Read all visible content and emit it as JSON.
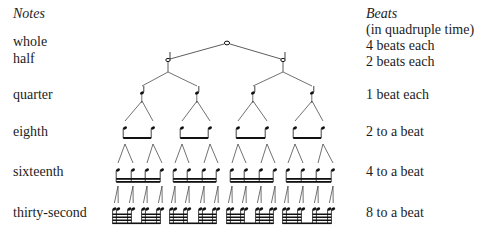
{
  "left_column": {
    "header": "Notes",
    "rows": [
      {
        "label": "whole",
        "y": 12
      },
      {
        "label": "half",
        "y": 28
      },
      {
        "label": "quarter",
        "y": 61
      },
      {
        "label": "eighth",
        "y": 104
      },
      {
        "label": "sixteenth",
        "y": 146
      },
      {
        "label": "thirty-second",
        "y": 188
      }
    ]
  },
  "right_column": {
    "header": "Beats",
    "subheader": "(in quadruple time)",
    "rows": [
      {
        "label": "4 beats each"
      },
      {
        "label": "2 beats each"
      },
      {
        "label": "1 beat each"
      },
      {
        "label": "2 to a beat"
      },
      {
        "label": "4 to a beat"
      },
      {
        "label": "8 to a beat"
      }
    ]
  },
  "tree": {
    "levels": [
      {
        "name": "whole",
        "count": 1,
        "y": 43,
        "x": [
          227
        ]
      },
      {
        "name": "half",
        "count": 2,
        "y": 60,
        "x": [
          168,
          283
        ]
      },
      {
        "name": "quarter",
        "count": 4,
        "y": 93,
        "x": [
          142,
          197,
          253,
          312
        ]
      },
      {
        "name": "eighth",
        "count": 8,
        "y": 128,
        "x": [
          125,
          153,
          182,
          210,
          238,
          267,
          295,
          323
        ]
      },
      {
        "name": "sixteenth",
        "count": 16,
        "y": 170,
        "x": [
          118,
          133,
          147,
          162,
          175,
          189,
          204,
          218,
          232,
          246,
          261,
          275,
          288,
          303,
          318,
          333
        ]
      },
      {
        "name": "thirty-second",
        "count": 32,
        "y": 209
      }
    ],
    "ink_color": "#111111",
    "line_color": "#333333"
  }
}
